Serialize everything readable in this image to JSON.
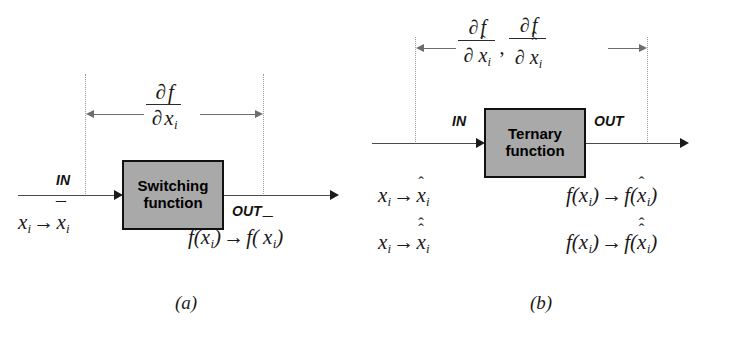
{
  "figure": {
    "background": "#ffffff",
    "box_fill": "#a9a9a9",
    "box_border": "#111111",
    "line_color": "#4a4a4a",
    "dim_color": "#6d6d6d",
    "dotted_color": "#9a9a9a"
  },
  "panel_a": {
    "caption": "(a)",
    "box_label_line1": "Switching",
    "box_label_line2": "function",
    "in_label": "IN",
    "out_label": "OUT",
    "derivative": {
      "numerator_partial": "∂",
      "numerator_f": "f",
      "denominator_partial": "∂",
      "denominator_var": "x",
      "denominator_sub": "i",
      "denominator_accent": "none",
      "text": "∂f / ∂xᵢ"
    },
    "input_mapping": {
      "from_var": "x",
      "from_sub": "i",
      "arrow": "→",
      "to_var": "x",
      "to_sub": "i",
      "to_accent": "bar",
      "text": "xᵢ → x̄ᵢ"
    },
    "output_mapping": {
      "from": "f(x",
      "from_sub": "i",
      "from_close": ")",
      "arrow": "→",
      "to_open": "f(",
      "to_var": "x",
      "to_sub": "i",
      "to_accent": "bar",
      "to_close": ")",
      "text": "f(xᵢ) → f( x̄ᵢ)"
    }
  },
  "panel_b": {
    "caption": "(b)",
    "box_label_line1": "Ternary",
    "box_label_line2": "function",
    "in_label": "IN",
    "out_label": "OUT",
    "separator": ",",
    "derivative_1": {
      "numerator_partial": "∂",
      "numerator_f": "f",
      "denominator_partial": "∂",
      "denominator_var": "x",
      "denominator_sub": "i",
      "denominator_accent": "hat",
      "text": "∂f / ∂x̂ᵢ"
    },
    "derivative_2": {
      "numerator_partial": "∂",
      "numerator_f": "f",
      "denominator_partial": "∂",
      "denominator_var": "x",
      "denominator_sub": "i",
      "denominator_accent": "double-hat",
      "text": "∂f / ∂x̂̂ᵢ"
    },
    "input_mapping_1": {
      "from_var": "x",
      "from_sub": "i",
      "arrow": "→",
      "to_var": "x",
      "to_sub": "i",
      "to_accent": "hat",
      "text": "xᵢ → x̂ᵢ"
    },
    "input_mapping_2": {
      "from_var": "x",
      "from_sub": "i",
      "arrow": "→",
      "to_var": "x",
      "to_sub": "i",
      "to_accent": "double-hat",
      "text": "xᵢ → x̂̂ᵢ"
    },
    "output_mapping_1": {
      "from": "f(x",
      "from_sub": "i",
      "from_close": ")",
      "arrow": "→",
      "to_open": "f(",
      "to_var": "x",
      "to_sub": "i",
      "to_accent": "hat",
      "to_close": ")",
      "text": "f(xᵢ) → f(x̂ᵢ)"
    },
    "output_mapping_2": {
      "from": "f(x",
      "from_sub": "i",
      "from_close": ")",
      "arrow": "→",
      "to_open": "f(",
      "to_var": "x",
      "to_sub": "i",
      "to_accent": "double-hat",
      "to_close": ")",
      "text": "f(xᵢ) → f(x̂̂ᵢ)"
    }
  },
  "glyphs": {
    "partial": "∂",
    "arrow_right": "→",
    "bar": "¯",
    "hat": "ˆ"
  }
}
